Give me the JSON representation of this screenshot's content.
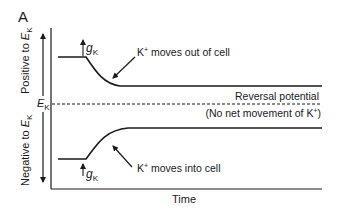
{
  "figure": {
    "panel_label": "A",
    "y_axis": {
      "positive_label": "Positive to ",
      "negative_label": "Negative to ",
      "e_symbol": "E",
      "e_subscript": "K"
    },
    "x_axis": {
      "label": "Time"
    },
    "reference": {
      "e_symbol": "E",
      "e_subscript": "K",
      "line_label": "Reversal potential",
      "line_sublabel_prefix": "(No net movement of K",
      "line_sublabel_sup": "+",
      "line_sublabel_suffix": ")"
    },
    "upper_trace": {
      "g_symbol": "g",
      "g_subscript": "K",
      "annotation_prefix": "K",
      "annotation_sup": "+",
      "annotation_suffix": " moves out of cell"
    },
    "lower_trace": {
      "g_symbol": "g",
      "g_subscript": "K",
      "annotation_prefix": "K",
      "annotation_sup": "+",
      "annotation_suffix": " moves into cell"
    },
    "colors": {
      "ink": "#1a1a1a",
      "background": "#ffffff"
    }
  }
}
